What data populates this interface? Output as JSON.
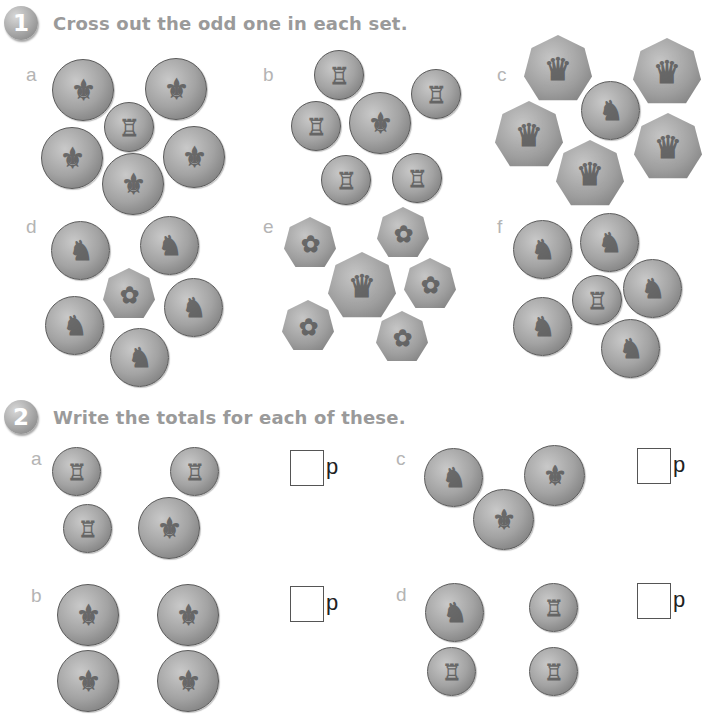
{
  "question1": {
    "number": "1",
    "instruction": "Cross out the odd one in each set.",
    "sets": [
      {
        "label": "a",
        "coins": [
          {
            "value": "2p",
            "x": 52,
            "y": 59,
            "d": 62
          },
          {
            "value": "2p",
            "x": 145,
            "y": 58,
            "d": 62
          },
          {
            "value": "1p",
            "x": 104,
            "y": 102,
            "d": 50
          },
          {
            "value": "2p",
            "x": 41,
            "y": 127,
            "d": 62
          },
          {
            "value": "2p",
            "x": 163,
            "y": 126,
            "d": 62
          },
          {
            "value": "2p",
            "x": 102,
            "y": 153,
            "d": 62
          }
        ]
      },
      {
        "label": "b",
        "coins": [
          {
            "value": "1p",
            "x": 314,
            "y": 50,
            "d": 50
          },
          {
            "value": "1p",
            "x": 411,
            "y": 69,
            "d": 50
          },
          {
            "value": "1p",
            "x": 291,
            "y": 101,
            "d": 50
          },
          {
            "value": "2p",
            "x": 349,
            "y": 92,
            "d": 62
          },
          {
            "value": "1p",
            "x": 321,
            "y": 155,
            "d": 50
          },
          {
            "value": "1p",
            "x": 392,
            "y": 153,
            "d": 50
          }
        ]
      },
      {
        "label": "c",
        "coins": [
          {
            "value": "50p",
            "x": 524,
            "y": 35,
            "d": 68
          },
          {
            "value": "50p",
            "x": 633,
            "y": 38,
            "d": 68
          },
          {
            "value": "10p",
            "x": 581,
            "y": 81,
            "d": 59
          },
          {
            "value": "50p",
            "x": 495,
            "y": 101,
            "d": 68
          },
          {
            "value": "50p",
            "x": 634,
            "y": 113,
            "d": 68
          },
          {
            "value": "50p",
            "x": 556,
            "y": 140,
            "d": 68
          }
        ]
      },
      {
        "label": "d",
        "coins": [
          {
            "value": "10p",
            "x": 51,
            "y": 221,
            "d": 59
          },
          {
            "value": "10p",
            "x": 140,
            "y": 216,
            "d": 59
          },
          {
            "value": "20p",
            "x": 103,
            "y": 268,
            "d": 52
          },
          {
            "value": "10p",
            "x": 45,
            "y": 296,
            "d": 59
          },
          {
            "value": "10p",
            "x": 164,
            "y": 278,
            "d": 59
          },
          {
            "value": "10p",
            "x": 110,
            "y": 328,
            "d": 59
          }
        ]
      },
      {
        "label": "e",
        "coins": [
          {
            "value": "20p",
            "x": 284,
            "y": 217,
            "d": 52
          },
          {
            "value": "20p",
            "x": 377,
            "y": 207,
            "d": 52
          },
          {
            "value": "50p",
            "x": 328,
            "y": 252,
            "d": 68
          },
          {
            "value": "20p",
            "x": 404,
            "y": 258,
            "d": 52
          },
          {
            "value": "20p",
            "x": 282,
            "y": 300,
            "d": 52
          },
          {
            "value": "20p",
            "x": 376,
            "y": 311,
            "d": 52
          }
        ]
      },
      {
        "label": "f",
        "coins": [
          {
            "value": "10p",
            "x": 513,
            "y": 220,
            "d": 59
          },
          {
            "value": "10p",
            "x": 580,
            "y": 213,
            "d": 59
          },
          {
            "value": "1p",
            "x": 572,
            "y": 275,
            "d": 50
          },
          {
            "value": "10p",
            "x": 623,
            "y": 259,
            "d": 59
          },
          {
            "value": "10p",
            "x": 513,
            "y": 297,
            "d": 59
          },
          {
            "value": "10p",
            "x": 601,
            "y": 319,
            "d": 59
          }
        ]
      }
    ]
  },
  "question2": {
    "number": "2",
    "instruction": "Write the totals for each of these.",
    "unit": "p",
    "problems": [
      {
        "label": "a",
        "label_x": 31,
        "label_y": 448,
        "box_x": 290,
        "box_y": 450,
        "answer": "",
        "coins": [
          {
            "value": "1p",
            "x": 52,
            "y": 447,
            "d": 49
          },
          {
            "value": "1p",
            "x": 170,
            "y": 447,
            "d": 49
          },
          {
            "value": "1p",
            "x": 63,
            "y": 504,
            "d": 49
          },
          {
            "value": "2p",
            "x": 138,
            "y": 497,
            "d": 62
          }
        ]
      },
      {
        "label": "c",
        "label_x": 396,
        "label_y": 448,
        "box_x": 637,
        "box_y": 448,
        "answer": "",
        "coins": [
          {
            "value": "10p",
            "x": 424,
            "y": 448,
            "d": 59
          },
          {
            "value": "2p",
            "x": 524,
            "y": 445,
            "d": 61
          },
          {
            "value": "2p",
            "x": 473,
            "y": 489,
            "d": 61
          }
        ]
      },
      {
        "label": "b",
        "label_x": 31,
        "label_y": 585,
        "box_x": 290,
        "box_y": 586,
        "answer": "",
        "coins": [
          {
            "value": "2p",
            "x": 57,
            "y": 584,
            "d": 62
          },
          {
            "value": "2p",
            "x": 157,
            "y": 584,
            "d": 62
          },
          {
            "value": "2p",
            "x": 57,
            "y": 650,
            "d": 62
          },
          {
            "value": "2p",
            "x": 157,
            "y": 650,
            "d": 62
          }
        ]
      },
      {
        "label": "d",
        "label_x": 396,
        "label_y": 584,
        "box_x": 637,
        "box_y": 583,
        "answer": "",
        "coins": [
          {
            "value": "10p",
            "x": 425,
            "y": 583,
            "d": 59
          },
          {
            "value": "1p",
            "x": 529,
            "y": 583,
            "d": 49
          },
          {
            "value": "1p",
            "x": 427,
            "y": 647,
            "d": 49
          },
          {
            "value": "1p",
            "x": 529,
            "y": 647,
            "d": 49
          }
        ]
      }
    ]
  },
  "layout": {
    "set_label_positions": {
      "a": [
        26,
        64
      ],
      "b": [
        263,
        64
      ],
      "c": [
        497,
        64
      ],
      "d": [
        26,
        216
      ],
      "e": [
        263,
        216
      ],
      "f": [
        497,
        216
      ]
    }
  },
  "coin_glyphs": {
    "1p": "♖",
    "2p": "⚜",
    "10p": "♞",
    "20p": "✿",
    "50p": "♛"
  }
}
